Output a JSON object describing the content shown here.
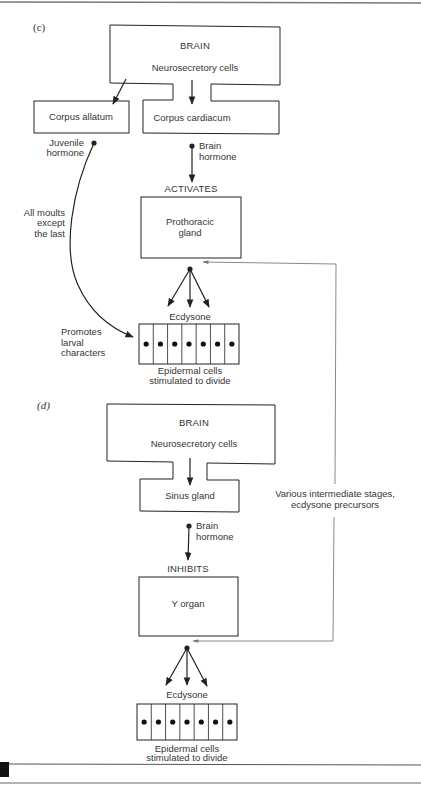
{
  "figure": {
    "colors": {
      "ink": "#222222",
      "text": "#353535",
      "feedback_line": "#8a8a8a",
      "page_mark": "#111111"
    },
    "panel_c": {
      "label": "(c)",
      "brain": {
        "title": "BRAIN",
        "subtitle": "Neurosecretory cells"
      },
      "corpus_allatum": "Corpus allatum",
      "corpus_cardiacum": "Corpus cardiacum",
      "juvenile_hormone": [
        "Juvenile",
        "hormone"
      ],
      "brain_hormone": [
        "Brain",
        "hormone"
      ],
      "action": "ACTIVATES",
      "gland": [
        "Prothoracic",
        "gland"
      ],
      "curve_label": [
        "All moults",
        "except",
        "the last"
      ],
      "promotes_label": [
        "Promotes",
        "larval",
        "characters"
      ],
      "ecdysone": "Ecdysone",
      "epidermal": [
        "Epidermal cells",
        "stimulated to divide"
      ],
      "cell_count": 7
    },
    "panel_d": {
      "label": "(d)",
      "brain": {
        "title": "BRAIN",
        "subtitle": "Neurosecretory cells"
      },
      "sinus_gland": "Sinus gland",
      "brain_hormone": [
        "Brain",
        "hormone"
      ],
      "action": "INHIBITS",
      "organ": "Y organ",
      "ecdysone": "Ecdysone",
      "epidermal": [
        "Epidermal cells",
        "stimulated to divide"
      ],
      "cell_count": 7
    },
    "feedback_label": [
      "Various intermediate stages,",
      "ecdysone precursors"
    ]
  }
}
